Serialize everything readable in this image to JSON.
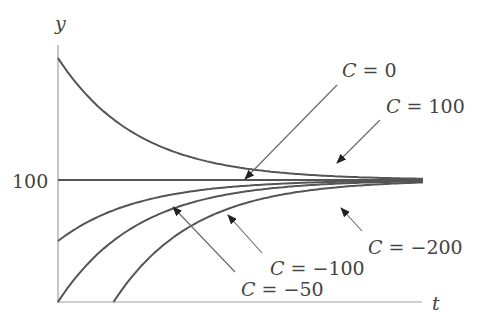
{
  "chart_data": {
    "type": "line",
    "title": "",
    "xlabel": "t",
    "ylabel": "y",
    "yticks": [
      {
        "value": 100,
        "label": "100"
      }
    ],
    "ylim": [
      0,
      200
    ],
    "grid": false,
    "equilibrium": 100,
    "series": [
      {
        "name": "C = 100",
        "C": 100,
        "t0": 0,
        "y0": 200
      },
      {
        "name": "C = 0",
        "C": 0,
        "t0": 0,
        "y0": 100
      },
      {
        "name": "C = -50",
        "C": -50,
        "t0": 0,
        "y0": 50
      },
      {
        "name": "C = -100",
        "C": -100,
        "t0": 0,
        "y0": 0
      },
      {
        "name": "C = -200",
        "C": -200,
        "t0": 0.7,
        "y0": 0
      }
    ],
    "annotations": [
      {
        "text": "C = 0",
        "points_to": "C = 0"
      },
      {
        "text": "C = 100",
        "points_to": "C = 100"
      },
      {
        "text": "C = −100",
        "points_to": "C = -100"
      },
      {
        "text": "C = −50",
        "points_to": "C = -50"
      },
      {
        "text": "C = −200",
        "points_to": "C = -200"
      }
    ]
  },
  "labels": {
    "y_axis": "y",
    "x_axis": "t",
    "tick_100": "100",
    "c0": "0",
    "c100": "100",
    "cm100": "−100",
    "cm50": "−50",
    "cm200": "−200",
    "C": "C",
    "eq": "="
  },
  "colors": {
    "curve": "#555555",
    "axis": "#999999",
    "text": "#444444"
  }
}
